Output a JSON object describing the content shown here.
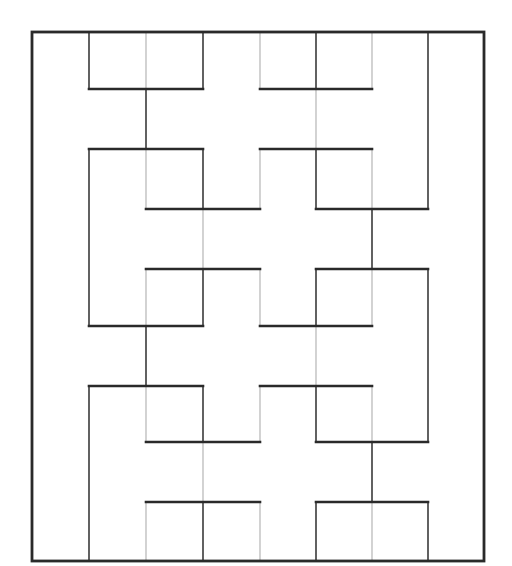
{
  "diagram": {
    "canvas": {
      "width": 512,
      "height": 566
    },
    "colors": {
      "background": "#ffffff",
      "thick": "#2a2a2a",
      "dark": "#3a3a3a",
      "light": "#b5b5b5"
    },
    "grid_x": [
      32,
      89,
      146,
      203,
      260,
      316,
      372,
      428,
      484
    ],
    "grid_y": [
      32,
      89,
      149,
      209,
      269,
      326,
      386,
      442,
      502,
      561
    ],
    "frame": {
      "x0": 0,
      "y0": 0,
      "x1": 8,
      "y1": 9
    },
    "horizontal_segments": [
      {
        "y": 1,
        "x0": 1,
        "x1": 3
      },
      {
        "y": 1,
        "x0": 4,
        "x1": 6
      },
      {
        "y": 2,
        "x0": 1,
        "x1": 3
      },
      {
        "y": 2,
        "x0": 4,
        "x1": 6
      },
      {
        "y": 3,
        "x0": 2,
        "x1": 4
      },
      {
        "y": 3,
        "x0": 5,
        "x1": 7
      },
      {
        "y": 4,
        "x0": 2,
        "x1": 4
      },
      {
        "y": 4,
        "x0": 5,
        "x1": 7
      },
      {
        "y": 5,
        "x0": 1,
        "x1": 3
      },
      {
        "y": 5,
        "x0": 4,
        "x1": 6
      },
      {
        "y": 6,
        "x0": 1,
        "x1": 3
      },
      {
        "y": 6,
        "x0": 4,
        "x1": 6
      },
      {
        "y": 7,
        "x0": 2,
        "x1": 4
      },
      {
        "y": 7,
        "x0": 5,
        "x1": 7
      },
      {
        "y": 8,
        "x0": 2,
        "x1": 4
      },
      {
        "y": 8,
        "x0": 5,
        "x1": 7
      }
    ],
    "vertical_segments": [
      {
        "x": 1,
        "y0": 0,
        "y1": 1,
        "style": "dark"
      },
      {
        "x": 1,
        "y0": 2,
        "y1": 5,
        "style": "dark"
      },
      {
        "x": 1,
        "y0": 6,
        "y1": 9,
        "style": "dark"
      },
      {
        "x": 2,
        "y0": 0,
        "y1": 1,
        "style": "light"
      },
      {
        "x": 2,
        "y0": 1,
        "y1": 2,
        "style": "dark"
      },
      {
        "x": 2,
        "y0": 2,
        "y1": 3,
        "style": "light"
      },
      {
        "x": 2,
        "y0": 4,
        "y1": 5,
        "style": "light"
      },
      {
        "x": 2,
        "y0": 5,
        "y1": 6,
        "style": "dark"
      },
      {
        "x": 2,
        "y0": 6,
        "y1": 7,
        "style": "light"
      },
      {
        "x": 2,
        "y0": 8,
        "y1": 9,
        "style": "light"
      },
      {
        "x": 3,
        "y0": 0,
        "y1": 1,
        "style": "dark"
      },
      {
        "x": 3,
        "y0": 2,
        "y1": 3,
        "style": "dark"
      },
      {
        "x": 3,
        "y0": 3,
        "y1": 4,
        "style": "light"
      },
      {
        "x": 3,
        "y0": 4,
        "y1": 5,
        "style": "dark"
      },
      {
        "x": 3,
        "y0": 6,
        "y1": 7,
        "style": "dark"
      },
      {
        "x": 3,
        "y0": 7,
        "y1": 8,
        "style": "light"
      },
      {
        "x": 3,
        "y0": 8,
        "y1": 9,
        "style": "dark"
      },
      {
        "x": 4,
        "y0": 0,
        "y1": 1,
        "style": "light"
      },
      {
        "x": 4,
        "y0": 2,
        "y1": 3,
        "style": "light"
      },
      {
        "x": 4,
        "y0": 4,
        "y1": 5,
        "style": "light"
      },
      {
        "x": 4,
        "y0": 6,
        "y1": 7,
        "style": "light"
      },
      {
        "x": 4,
        "y0": 8,
        "y1": 9,
        "style": "light"
      },
      {
        "x": 5,
        "y0": 0,
        "y1": 1,
        "style": "dark"
      },
      {
        "x": 5,
        "y0": 1,
        "y1": 2,
        "style": "light"
      },
      {
        "x": 5,
        "y0": 2,
        "y1": 3,
        "style": "dark"
      },
      {
        "x": 5,
        "y0": 4,
        "y1": 5,
        "style": "dark"
      },
      {
        "x": 5,
        "y0": 5,
        "y1": 6,
        "style": "light"
      },
      {
        "x": 5,
        "y0": 6,
        "y1": 7,
        "style": "dark"
      },
      {
        "x": 5,
        "y0": 8,
        "y1": 9,
        "style": "dark"
      },
      {
        "x": 6,
        "y0": 0,
        "y1": 1,
        "style": "light"
      },
      {
        "x": 6,
        "y0": 2,
        "y1": 3,
        "style": "light"
      },
      {
        "x": 6,
        "y0": 3,
        "y1": 4,
        "style": "dark"
      },
      {
        "x": 6,
        "y0": 4,
        "y1": 5,
        "style": "light"
      },
      {
        "x": 6,
        "y0": 6,
        "y1": 7,
        "style": "light"
      },
      {
        "x": 6,
        "y0": 7,
        "y1": 8,
        "style": "dark"
      },
      {
        "x": 6,
        "y0": 8,
        "y1": 9,
        "style": "light"
      },
      {
        "x": 7,
        "y0": 0,
        "y1": 3,
        "style": "dark"
      },
      {
        "x": 7,
        "y0": 4,
        "y1": 7,
        "style": "dark"
      },
      {
        "x": 7,
        "y0": 8,
        "y1": 9,
        "style": "dark"
      }
    ]
  }
}
